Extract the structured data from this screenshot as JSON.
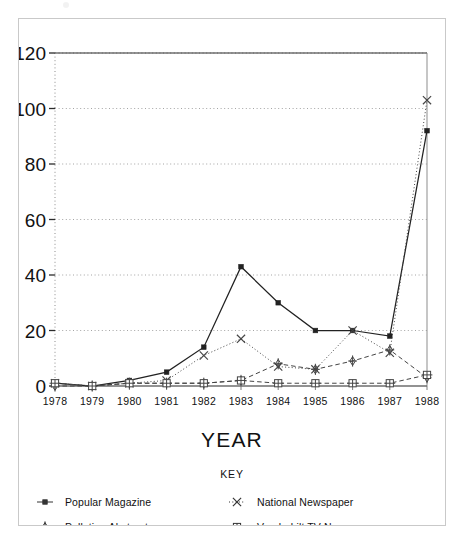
{
  "figure": {
    "axis_title": "YEAR",
    "key_title": "KEY"
  },
  "chart_data": {
    "type": "line",
    "title": "",
    "xlabel": "YEAR",
    "ylabel": "",
    "xlim": [
      1978,
      1988
    ],
    "ylim": [
      0,
      120
    ],
    "yticks": [
      0,
      20,
      40,
      60,
      80,
      100,
      120
    ],
    "grid": true,
    "legend_position": "bottom",
    "legend_title": "KEY",
    "categories": [
      "1978",
      "1979",
      "1980",
      "1981",
      "1982",
      "1983",
      "1984",
      "1985",
      "1986",
      "1987",
      "1988"
    ],
    "x": [
      1978,
      1979,
      1980,
      1981,
      1982,
      1983,
      1984,
      1985,
      1986,
      1987,
      1988
    ],
    "series": [
      {
        "name": "Popular Magazine",
        "marker": "filled-square",
        "line": "solid",
        "color": "#222222",
        "values": [
          1,
          0,
          2,
          5,
          14,
          43,
          30,
          20,
          20,
          18,
          92
        ]
      },
      {
        "name": "National Newspaper",
        "marker": "x",
        "line": "dotted",
        "color": "#444444",
        "values": [
          1,
          0,
          1,
          2,
          11,
          17,
          7,
          6,
          20,
          12,
          103
        ]
      },
      {
        "name": "Pollution Abstracts",
        "marker": "diamond-star",
        "line": "dashed",
        "color": "#444444",
        "values": [
          0,
          0,
          1,
          1,
          1,
          2,
          8,
          6,
          9,
          13,
          3
        ]
      },
      {
        "name": "Vanderbilt TV News",
        "marker": "square-plus",
        "line": "dashed",
        "color": "#444444",
        "values": [
          1,
          0,
          1,
          1,
          1,
          2,
          1,
          1,
          1,
          1,
          4
        ]
      }
    ]
  },
  "legend": [
    {
      "label": "Popular Magazine",
      "marker": "filled-square",
      "line": "solid"
    },
    {
      "label": "National Newspaper",
      "marker": "x",
      "line": "dotted"
    },
    {
      "label": "Pollution Abstracts",
      "marker": "diamond-star",
      "line": "dashed"
    },
    {
      "label": "Vanderbilt TV News",
      "marker": "square-plus",
      "line": "dashed"
    }
  ]
}
